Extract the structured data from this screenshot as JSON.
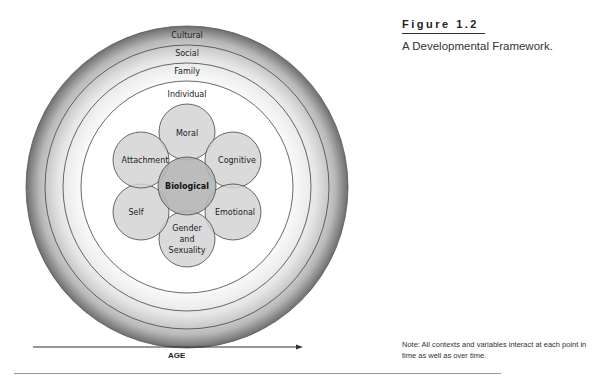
{
  "figure": {
    "number_label": "Figure 1.2",
    "caption": "A Developmental Framework.",
    "note": "Note: All contexts and variables interact at each point in time as well as over time."
  },
  "diagram": {
    "rings": [
      {
        "label": "Cultural"
      },
      {
        "label": "Social"
      },
      {
        "label": "Family"
      },
      {
        "label": "Individual"
      }
    ],
    "center": {
      "label": "Biological"
    },
    "petals": [
      {
        "label": "Moral"
      },
      {
        "label": "Cognitive"
      },
      {
        "label": "Emotional"
      },
      {
        "label": "Gender"
      },
      {
        "label": "and"
      },
      {
        "label": "Sexuality"
      },
      {
        "label": "Self"
      },
      {
        "label": "Attachment"
      }
    ],
    "axis": {
      "label": "AGE"
    }
  },
  "colors": {
    "petal_fill": "#d4d4d4",
    "center_fill": "#b5b5b5",
    "line": "#444444"
  }
}
